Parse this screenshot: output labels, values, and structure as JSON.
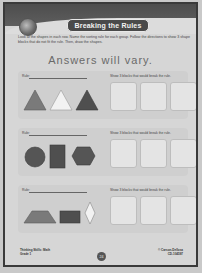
{
  "header": {
    "title": "Breaking the Rules",
    "icon": "globe-icon"
  },
  "instructions": "Look at the shapes in each row. Name the sorting rule for each group. Follow the directions to show 3 shape blocks that do not fit the rule. Then, draw the shapes.",
  "answer_note": "Answers will vary.",
  "rows": [
    {
      "rule_label": "Rule:",
      "prompt": "Show 3 blocks that would break the rule.",
      "shapes": [
        "triangle-medium-gray",
        "triangle-white",
        "triangle-dark-gray"
      ]
    },
    {
      "rule_label": "Rule:",
      "prompt": "Show 3 blocks that would break the rule.",
      "shapes": [
        "circle-dark-gray",
        "rectangle-dark-gray",
        "hexagon-dark-gray"
      ]
    },
    {
      "rule_label": "Rule:",
      "prompt": "Show 3 blocks that would break the rule.",
      "shapes": [
        "trapezoid-medium-gray",
        "rectangle-dark-gray",
        "rhombus-white"
      ]
    }
  ],
  "footer": {
    "left_line1": "Thinking Skills: Math",
    "left_line2": "Grade 1",
    "page_number": "24",
    "right_line1": "© Carson-Dellosa",
    "right_line2": "CD-104597"
  },
  "colors": {
    "header_band": "#4d4d4d",
    "page_bg": "#d6d6d6",
    "shape_dark": "#4f4f4f",
    "shape_medium": "#7a7a7a",
    "shape_light": "#f2f2f2"
  }
}
